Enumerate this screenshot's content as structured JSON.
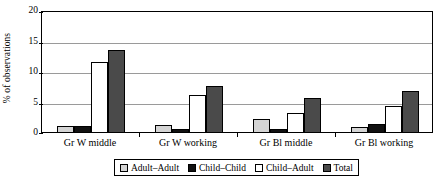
{
  "chart_data": {
    "type": "bar",
    "title": "",
    "xlabel": "",
    "ylabel": "% of observations",
    "ylim": [
      0,
      20
    ],
    "yticks": [
      0,
      5,
      10,
      15,
      20
    ],
    "grid": true,
    "legend_position": "bottom",
    "categories": [
      "Gr W middle",
      "Gr W working",
      "Gr Bl middle",
      "Gr Bl working"
    ],
    "series": [
      {
        "name": "Adult–Adult",
        "color": "#d4d4d4",
        "values": [
          1.0,
          1.1,
          2.2,
          0.8
        ]
      },
      {
        "name": "Child–Child",
        "color": "#111111",
        "values": [
          0.95,
          0.5,
          0.5,
          1.4
        ]
      },
      {
        "name": "Child–Adult",
        "color": "#ffffff",
        "values": [
          11.5,
          6.1,
          3.1,
          4.3
        ]
      },
      {
        "name": "Total",
        "color": "#4a4a4a",
        "values": [
          13.5,
          7.6,
          5.7,
          6.7
        ]
      }
    ]
  },
  "axis": {
    "y_title": "% of observations",
    "y_tick_labels": [
      "20",
      "15",
      "10",
      "5",
      "0"
    ]
  },
  "legend": {
    "items": [
      {
        "label": "Adult–Adult",
        "swatch": "light-gray-square"
      },
      {
        "label": "Child–Child",
        "swatch": "black-square"
      },
      {
        "label": "Child–Adult",
        "swatch": "white-square"
      },
      {
        "label": "Total",
        "swatch": "dark-gray-square"
      }
    ]
  }
}
